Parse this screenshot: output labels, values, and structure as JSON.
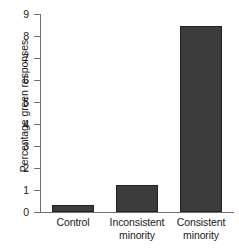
{
  "chart_data": {
    "type": "bar",
    "title": "",
    "xlabel": "",
    "ylabel": "Percentage green responses",
    "categories": [
      "Control",
      "Inconsistent minority",
      "Consistent minority"
    ],
    "category_lines": [
      [
        "Control"
      ],
      [
        "Inconsistent",
        "minority"
      ],
      [
        "Consistent",
        "minority"
      ]
    ],
    "values": [
      0.3,
      1.25,
      8.45
    ],
    "ylim": [
      0,
      9
    ],
    "ytick_labels": [
      "0",
      "1",
      "2",
      "3",
      "4",
      "5",
      "6",
      "7",
      "8",
      "9"
    ],
    "ytick_values": [
      0,
      1,
      2,
      3,
      4,
      5,
      6,
      7,
      8,
      9
    ],
    "grid": false,
    "legend": "none",
    "bar_color": "#3c3c3c",
    "bar_border_color": "#222222",
    "axis_color": "#6e6e6e",
    "background_color": "#ffffff"
  }
}
